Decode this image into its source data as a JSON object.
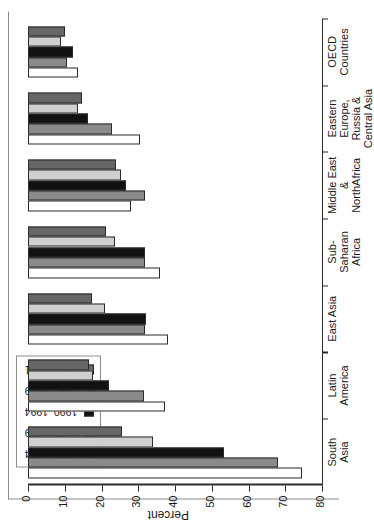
{
  "chart_data": {
    "type": "bar",
    "orientation": "horizontal",
    "title": "",
    "xlabel": "Percent",
    "ylabel": "",
    "xlim": [
      0,
      80
    ],
    "xticks": [
      0,
      10,
      20,
      30,
      40,
      50,
      60,
      70,
      80
    ],
    "grid": false,
    "legend_position": "top-left",
    "categories": [
      "South Asia",
      "Latin America",
      "East Asia",
      "Sub-Saharan Africa",
      "Middle East & NorthAfrica",
      "Eastern Europe, Russia & Central Asia",
      "OECD Countries"
    ],
    "category_label_lines": [
      [
        "South",
        "Asia"
      ],
      [
        "Latin",
        "America"
      ],
      [
        "East Asia"
      ],
      [
        "Sub-",
        "Saharan",
        "Africa"
      ],
      [
        "Middle East",
        "&",
        "NorthAfrica"
      ],
      [
        "Eastern",
        "Europe,",
        "Russia &",
        "Central Asia"
      ],
      [
        "OECD",
        "Countries"
      ]
    ],
    "series": [
      {
        "name": "1980–1984",
        "color": "#ffffff",
        "values": [
          74.5,
          37.3,
          38.1,
          35.9,
          28.0,
          30.5,
          13.6
        ]
      },
      {
        "name": "1985–1989",
        "color": "#8a8a8a",
        "values": [
          67.9,
          31.6,
          31.8,
          31.8,
          31.8,
          22.9,
          10.6
        ]
      },
      {
        "name": "1990–1994",
        "color": "#121212",
        "values": [
          53.3,
          22.0,
          32.1,
          31.8,
          26.7,
          16.3,
          12.2
        ]
      },
      {
        "name": "1995–1999",
        "color": "#cfcfcf",
        "values": [
          34.0,
          17.7,
          20.9,
          23.7,
          25.3,
          13.6,
          9.0
        ]
      },
      {
        "name": "2000–2001",
        "color": "#666666",
        "values": [
          25.6,
          16.6,
          17.4,
          21.2,
          23.9,
          14.7,
          10.1
        ]
      }
    ]
  },
  "legend": {
    "items": [
      {
        "label": "1980–1984",
        "color": "#ffffff"
      },
      {
        "label": "1985–1989",
        "color": "#8a8a8a"
      },
      {
        "label": "1990–1994",
        "color": "#121212"
      },
      {
        "label": "1995–1999",
        "color": "#cfcfcf"
      },
      {
        "label": "2000–2001",
        "color": "#666666"
      }
    ]
  },
  "axis": {
    "value_axis_title": "Percent",
    "tick_labels": [
      "80",
      "70",
      "60",
      "50",
      "40",
      "30",
      "20",
      "10",
      "0"
    ]
  }
}
